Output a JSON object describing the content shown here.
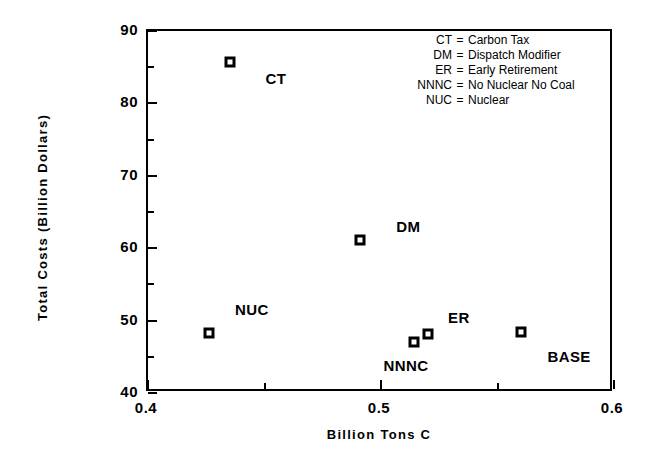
{
  "chart_data": {
    "type": "scatter",
    "title": "",
    "xlabel": "Billion Tons C",
    "ylabel": "Total Costs (Billion Dollars)",
    "xlim": [
      0.4,
      0.6
    ],
    "ylim": [
      40,
      90
    ],
    "xticks": [
      0.4,
      0.5,
      0.6
    ],
    "xtick_labels": [
      "0.4",
      "0.5",
      "0.6"
    ],
    "xminor_ticks": [
      0.45,
      0.55
    ],
    "yticks": [
      40,
      50,
      60,
      70,
      80,
      90
    ],
    "ytick_labels": [
      "40",
      "50",
      "60",
      "70",
      "80",
      "90"
    ],
    "yminor_ticks": [
      45,
      55,
      65,
      75,
      85
    ],
    "grid": false,
    "legend_position": "top-right",
    "points": [
      {
        "label": "CT",
        "x": 0.436,
        "y": 85.4,
        "label_dx": 46,
        "label_dy": 16
      },
      {
        "label": "DM",
        "x": 0.492,
        "y": 60.9,
        "label_dx": 48,
        "label_dy": -14
      },
      {
        "label": "NUC",
        "x": 0.427,
        "y": 48.0,
        "label_dx": 43,
        "label_dy": -24
      },
      {
        "label": "NNNC",
        "x": 0.515,
        "y": 46.7,
        "label_dx": -8,
        "label_dy": 23
      },
      {
        "label": "ER",
        "x": 0.521,
        "y": 47.9,
        "label_dx": 31,
        "label_dy": -17
      },
      {
        "label": "BASE",
        "x": 0.561,
        "y": 48.2,
        "label_dx": 48,
        "label_dy": 24
      }
    ],
    "legend_entries": [
      {
        "abbr": "CT",
        "eq": "=",
        "desc": "Carbon Tax"
      },
      {
        "abbr": "DM",
        "eq": "=",
        "desc": "Dispatch Modifier"
      },
      {
        "abbr": "ER",
        "eq": "=",
        "desc": "Early Retirement"
      },
      {
        "abbr": "NNNC",
        "eq": "=",
        "desc": "No Nuclear No Coal"
      },
      {
        "abbr": "NUC",
        "eq": "=",
        "desc": "Nuclear"
      }
    ],
    "colors": {
      "marker": "#000000",
      "marker_center": "#ffffff",
      "axis": "#000000",
      "background": "#ffffff"
    }
  }
}
